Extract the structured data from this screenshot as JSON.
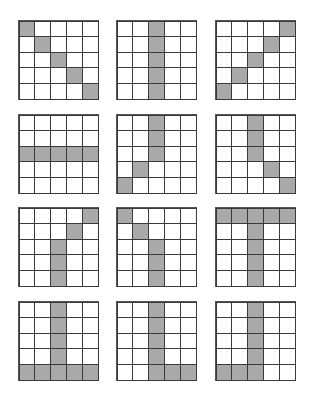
{
  "figure": {
    "grid_size": 5,
    "colors": {
      "filled": "#a9a9a9",
      "empty": "#ffffff",
      "line": "#3a3a3a"
    },
    "panels": [
      {
        "id": "r1c1",
        "pattern": [
          [
            1,
            0,
            0,
            0,
            0
          ],
          [
            0,
            1,
            0,
            0,
            0
          ],
          [
            0,
            0,
            1,
            0,
            0
          ],
          [
            0,
            0,
            0,
            1,
            0
          ],
          [
            0,
            0,
            0,
            0,
            1
          ]
        ]
      },
      {
        "id": "r1c2",
        "pattern": [
          [
            0,
            0,
            1,
            0,
            0
          ],
          [
            0,
            0,
            1,
            0,
            0
          ],
          [
            0,
            0,
            1,
            0,
            0
          ],
          [
            0,
            0,
            1,
            0,
            0
          ],
          [
            0,
            0,
            1,
            0,
            0
          ]
        ]
      },
      {
        "id": "r1c3",
        "pattern": [
          [
            0,
            0,
            0,
            0,
            1
          ],
          [
            0,
            0,
            0,
            1,
            0
          ],
          [
            0,
            0,
            1,
            0,
            0
          ],
          [
            0,
            1,
            0,
            0,
            0
          ],
          [
            1,
            0,
            0,
            0,
            0
          ]
        ]
      },
      {
        "id": "r2c1",
        "pattern": [
          [
            0,
            0,
            0,
            0,
            0
          ],
          [
            0,
            0,
            0,
            0,
            0
          ],
          [
            1,
            1,
            1,
            1,
            1
          ],
          [
            0,
            0,
            0,
            0,
            0
          ],
          [
            0,
            0,
            0,
            0,
            0
          ]
        ]
      },
      {
        "id": "r2c2",
        "pattern": [
          [
            0,
            0,
            1,
            0,
            0
          ],
          [
            0,
            0,
            1,
            0,
            0
          ],
          [
            0,
            0,
            1,
            0,
            0
          ],
          [
            0,
            1,
            0,
            0,
            0
          ],
          [
            1,
            0,
            0,
            0,
            0
          ]
        ]
      },
      {
        "id": "r2c3",
        "pattern": [
          [
            0,
            0,
            1,
            0,
            0
          ],
          [
            0,
            0,
            1,
            0,
            0
          ],
          [
            0,
            0,
            1,
            0,
            0
          ],
          [
            0,
            0,
            0,
            1,
            0
          ],
          [
            0,
            0,
            0,
            0,
            1
          ]
        ]
      },
      {
        "id": "r3c1",
        "pattern": [
          [
            0,
            0,
            0,
            0,
            1
          ],
          [
            0,
            0,
            0,
            1,
            0
          ],
          [
            0,
            0,
            1,
            0,
            0
          ],
          [
            0,
            0,
            1,
            0,
            0
          ],
          [
            0,
            0,
            1,
            0,
            0
          ]
        ]
      },
      {
        "id": "r3c2",
        "pattern": [
          [
            1,
            0,
            0,
            0,
            0
          ],
          [
            0,
            1,
            0,
            0,
            0
          ],
          [
            0,
            0,
            1,
            0,
            0
          ],
          [
            0,
            0,
            1,
            0,
            0
          ],
          [
            0,
            0,
            1,
            0,
            0
          ]
        ]
      },
      {
        "id": "r3c3",
        "pattern": [
          [
            1,
            1,
            1,
            1,
            1
          ],
          [
            0,
            0,
            1,
            0,
            0
          ],
          [
            0,
            0,
            1,
            0,
            0
          ],
          [
            0,
            0,
            1,
            0,
            0
          ],
          [
            0,
            0,
            1,
            0,
            0
          ]
        ]
      },
      {
        "id": "r4c1",
        "pattern": [
          [
            0,
            0,
            1,
            0,
            0
          ],
          [
            0,
            0,
            1,
            0,
            0
          ],
          [
            0,
            0,
            1,
            0,
            0
          ],
          [
            0,
            0,
            1,
            0,
            0
          ],
          [
            1,
            1,
            1,
            1,
            1
          ]
        ]
      },
      {
        "id": "r4c2",
        "pattern": [
          [
            0,
            0,
            1,
            0,
            0
          ],
          [
            0,
            0,
            1,
            0,
            0
          ],
          [
            0,
            0,
            1,
            0,
            0
          ],
          [
            0,
            0,
            1,
            0,
            0
          ],
          [
            0,
            0,
            1,
            1,
            1
          ]
        ]
      },
      {
        "id": "r4c3",
        "pattern": [
          [
            0,
            0,
            1,
            0,
            0
          ],
          [
            0,
            0,
            1,
            0,
            0
          ],
          [
            0,
            0,
            1,
            0,
            0
          ],
          [
            0,
            0,
            1,
            0,
            0
          ],
          [
            1,
            1,
            1,
            0,
            0
          ]
        ]
      }
    ]
  }
}
